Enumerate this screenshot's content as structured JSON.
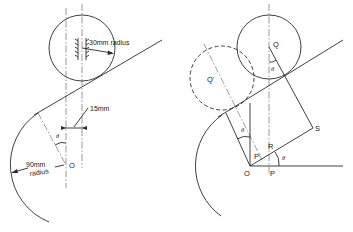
{
  "figure": {
    "left_panel": {
      "follower_radius_label": "30mm radius",
      "offset_label": "15mm",
      "cam_radius_label_line1": "90mm",
      "cam_radius_label_line2": "radius",
      "center_label": "O",
      "angle_label": "θ"
    },
    "right_panel": {
      "point_labels": {
        "Q": "Q",
        "Q_prime": "Q'",
        "S": "S",
        "R": "R",
        "O": "O",
        "P": "P",
        "P_prime": "P'"
      },
      "angle_labels": [
        "θ",
        "θ",
        "θ"
      ]
    }
  }
}
